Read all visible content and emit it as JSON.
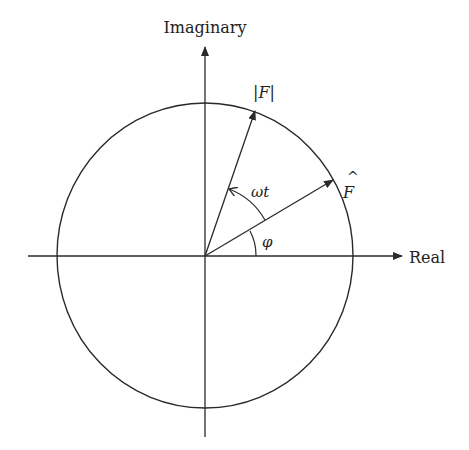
{
  "diagram": {
    "type": "phasor-diagram",
    "axes": {
      "vertical_label": "Imaginary",
      "horizontal_label": "Real"
    },
    "vectors": [
      {
        "id": "magnitude",
        "label": "|F|",
        "description": "rotating vector at angle φ + ωt"
      },
      {
        "id": "phasor",
        "label": "F",
        "accent": "^",
        "description": "complex amplitude vector at angle φ"
      }
    ],
    "angles": [
      {
        "id": "phase",
        "label": "φ",
        "from": "Real axis",
        "to": "F̂"
      },
      {
        "id": "rotation",
        "label": "ωt",
        "from": "F̂",
        "to": "|F|"
      }
    ],
    "colors": {
      "stroke": "#2a2a2a",
      "text": "#222222",
      "background": "#ffffff"
    }
  }
}
